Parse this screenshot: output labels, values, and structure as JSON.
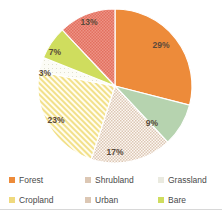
{
  "chart_data": {
    "type": "pie",
    "title": "",
    "subtitle": "",
    "xlabel": "",
    "ylabel": "",
    "legend_position": "bottom",
    "grid": false,
    "labels_format": "percent",
    "categories": [
      "Forest",
      "Shrubland",
      "Urban",
      "Cropland",
      "Grassland",
      "Bare"
    ],
    "values": [
      29,
      9,
      17,
      23,
      3,
      7
    ],
    "value_labels": [
      "29%",
      "9%",
      "17%",
      "23%",
      "3%",
      "7%"
    ],
    "slices": [
      {
        "name": "Forest",
        "value": 29,
        "label": "29%",
        "color": "#ED8B3A",
        "pattern": "solid",
        "start_angle": 0,
        "end_angle": 104.4,
        "label_x": 161,
        "label_y": 48
      },
      {
        "name": "Shrubland",
        "value": 9,
        "label": "9%",
        "color": "#B6D3AF",
        "pattern": "solid",
        "start_angle": 104.4,
        "end_angle": 136.8,
        "label_x": 152,
        "label_y": 126
      },
      {
        "name": "Urban",
        "value": 17,
        "label": "17%",
        "color": "#E3D3C4",
        "pattern": "checker",
        "start_angle": 136.8,
        "end_angle": 198.0,
        "label_x": 115,
        "label_y": 155
      },
      {
        "name": "Cropland",
        "value": 23,
        "label": "23%",
        "color": "#F2E08A",
        "pattern": "diagonal",
        "start_angle": 198.0,
        "end_angle": 280.8,
        "label_x": 56,
        "label_y": 123
      },
      {
        "name": "Grassland",
        "value": 3,
        "label": "3%",
        "color": "#FAFAF2",
        "pattern": "sparse",
        "start_angle": 280.8,
        "end_angle": 291.6,
        "label_x": 45,
        "label_y": 76
      },
      {
        "name": "Bare",
        "value": 7,
        "label": "7%",
        "color": "#CFDD5E",
        "pattern": "solid",
        "start_angle": 291.6,
        "end_angle": 316.8,
        "label_x": 55,
        "label_y": 55
      },
      {
        "name": "Forest-second",
        "value": 13,
        "label": "13%",
        "color": "#E98274",
        "pattern": "dotted",
        "start_angle": 316.8,
        "end_angle": 360.0,
        "label_x": 89,
        "label_y": 25
      }
    ],
    "extra_slice_note": "13%"
  },
  "legend": {
    "items": [
      {
        "label": "Forest",
        "color": "#ED8B3A",
        "pattern": "solid"
      },
      {
        "label": "Shrubland",
        "color": "#E3D3C4",
        "pattern": "checker"
      },
      {
        "label": "Grassland",
        "color": "#FAFAF2",
        "pattern": "sparse"
      },
      {
        "label": "Cropland",
        "color": "#F2E08A",
        "pattern": "diagonal"
      },
      {
        "label": "Urban",
        "color": "#E3D3C4",
        "pattern": "checker"
      },
      {
        "label": "Bare",
        "color": "#CFDD5E",
        "pattern": "solid"
      }
    ]
  }
}
